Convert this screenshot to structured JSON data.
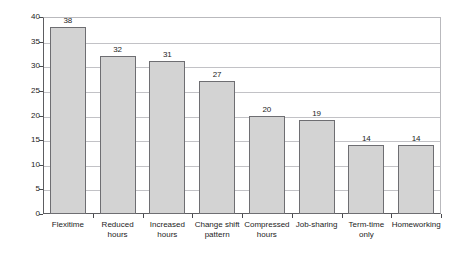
{
  "figure": {
    "top_caption_fragment": "",
    "bottom_caption_fragment": ""
  },
  "chart_data": {
    "type": "bar",
    "title": "",
    "xlabel": "",
    "ylabel": "Per cent of employees",
    "categories": [
      "Flexitime",
      "Reduced hours",
      "Increased hours",
      "Change shift pattern",
      "Compressed hours",
      "Job-sharing",
      "Term-time only",
      "Homeworking"
    ],
    "category_lines": [
      [
        "Flexitime"
      ],
      [
        "Reduced",
        "hours"
      ],
      [
        "Increased",
        "hours"
      ],
      [
        "Change shift",
        "pattern"
      ],
      [
        "Compressed",
        "hours"
      ],
      [
        "Job-sharing"
      ],
      [
        "Term-time",
        "only"
      ],
      [
        "Homeworking"
      ]
    ],
    "values": [
      38,
      32,
      31,
      27,
      20,
      19,
      14,
      14
    ],
    "ylim": [
      0,
      40
    ],
    "yticks": [
      0,
      5,
      10,
      15,
      20,
      25,
      30,
      35,
      40
    ],
    "ytick_labels": [
      "0",
      "5",
      "10",
      "15",
      "20",
      "25",
      "30",
      "35",
      "40"
    ],
    "grid": true,
    "grid_axis": "y",
    "legend": false,
    "bar_color": "#d3d3d3",
    "bar_edge_color": "#6e6e72",
    "gridline_color": "#c2c2c6",
    "axis_color": "#5d5d61",
    "show_value_labels": true
  }
}
